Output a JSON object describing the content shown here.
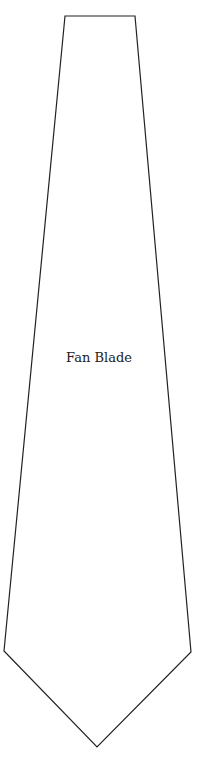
{
  "diagram": {
    "label": "Fan Blade",
    "shape": "blade-outline",
    "stroke_color": "#222222",
    "fill_color": "#ffffff"
  }
}
